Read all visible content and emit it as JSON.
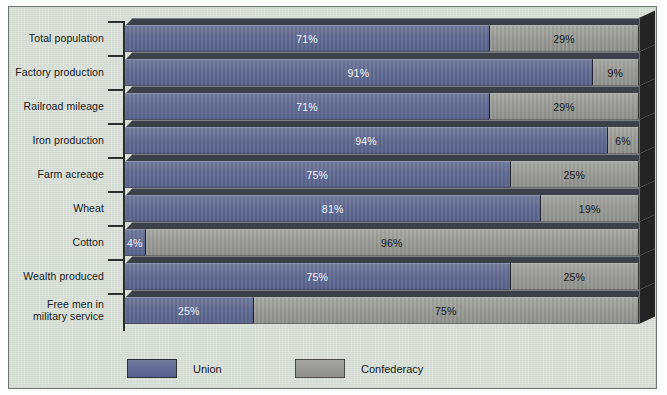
{
  "chart_data": {
    "type": "bar",
    "orientation": "horizontal",
    "stacked": true,
    "stacked_percent": true,
    "title": "",
    "xlabel": "",
    "ylabel": "",
    "xlim": [
      0,
      100
    ],
    "grid": false,
    "legend_position": "bottom",
    "categories": [
      "Total population",
      "Factory production",
      "Railroad mileage",
      "Iron production",
      "Farm acreage",
      "Wheat",
      "Cotton",
      "Wealth produced",
      "Free men in\nmilitary service"
    ],
    "series": [
      {
        "name": "Union",
        "color": "#626c93",
        "values": [
          71,
          91,
          71,
          94,
          75,
          81,
          4,
          75,
          25
        ],
        "labels": [
          "71%",
          "91%",
          "71%",
          "94%",
          "75%",
          "81%",
          "4%",
          "75%",
          "25%"
        ]
      },
      {
        "name": "Confederacy",
        "color": "#9a9a96",
        "values": [
          29,
          9,
          29,
          6,
          25,
          19,
          96,
          25,
          75
        ],
        "labels": [
          "29%",
          "9%",
          "29%",
          "6%",
          "25%",
          "19%",
          "96%",
          "25%",
          "75%"
        ]
      }
    ],
    "legend": [
      "Union",
      "Confederacy"
    ],
    "background_color": "#d5ddd3",
    "frame_color": "#6d7570"
  },
  "legend": {
    "union_label": "Union",
    "confederacy_label": "Confederacy"
  },
  "rows": [
    {
      "label": "Total population",
      "union": "71%",
      "conf": "29%",
      "union_pct": 71,
      "conf_pct": 29
    },
    {
      "label": "Factory production",
      "union": "91%",
      "conf": "9%",
      "union_pct": 91,
      "conf_pct": 9
    },
    {
      "label": "Railroad mileage",
      "union": "71%",
      "conf": "29%",
      "union_pct": 71,
      "conf_pct": 29
    },
    {
      "label": "Iron production",
      "union": "94%",
      "conf": "6%",
      "union_pct": 94,
      "conf_pct": 6
    },
    {
      "label": "Farm acreage",
      "union": "75%",
      "conf": "25%",
      "union_pct": 75,
      "conf_pct": 25
    },
    {
      "label": "Wheat",
      "union": "81%",
      "conf": "19%",
      "union_pct": 81,
      "conf_pct": 19
    },
    {
      "label": "Cotton",
      "union": "4%",
      "conf": "96%",
      "union_pct": 4,
      "conf_pct": 96
    },
    {
      "label": "Wealth produced",
      "union": "75%",
      "conf": "25%",
      "union_pct": 75,
      "conf_pct": 25
    },
    {
      "label": "Free men in\nmilitary service",
      "union": "25%",
      "conf": "75%",
      "union_pct": 25,
      "conf_pct": 75
    }
  ]
}
